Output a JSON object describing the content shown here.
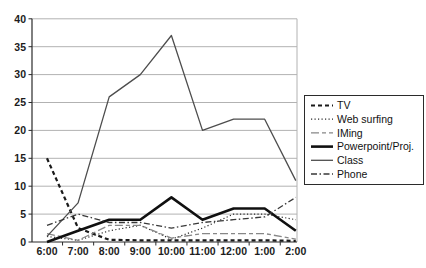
{
  "chart_data": {
    "type": "line",
    "categories": [
      "6:00",
      "7:00",
      "8:00",
      "9:00",
      "10:00",
      "11:00",
      "12:00",
      "1:00",
      "2:00"
    ],
    "series": [
      {
        "name": "TV",
        "values": [
          15,
          2.5,
          0.4,
          0.3,
          0.3,
          0.3,
          0.3,
          0.3,
          0.2
        ],
        "color": "#1a1a1a",
        "width": 2.2,
        "dash": "4,3"
      },
      {
        "name": "Web surfing",
        "values": [
          1,
          0.3,
          2,
          3,
          0.5,
          2.5,
          5,
          5,
          4
        ],
        "color": "#2b2b2b",
        "width": 1.2,
        "dash": "1.2,2.3"
      },
      {
        "name": "IMing",
        "values": [
          1.5,
          0.3,
          3,
          3,
          0.7,
          1.5,
          1.5,
          1.5,
          0.5
        ],
        "color": "#878787",
        "width": 1.3,
        "dash": "8,3,4,3"
      },
      {
        "name": "Powerpoint/Proj.",
        "values": [
          0,
          2,
          4,
          4,
          8,
          4,
          6,
          6,
          2
        ],
        "color": "#101010",
        "width": 2.6,
        "dash": ""
      },
      {
        "name": "Class",
        "values": [
          1,
          7,
          26,
          30,
          37,
          20,
          22,
          22,
          11
        ],
        "color": "#4d4d4d",
        "width": 1.3,
        "dash": ""
      },
      {
        "name": "Phone",
        "values": [
          3,
          5,
          3.5,
          3.5,
          2.5,
          3.5,
          4,
          4.5,
          8
        ],
        "color": "#383838",
        "width": 1.3,
        "dash": "6,2.5,1.5,2.5"
      }
    ],
    "ylim": [
      0,
      40
    ],
    "ytick_step": 5,
    "yticks": [
      "0",
      "5",
      "10",
      "15",
      "20",
      "25",
      "30",
      "35",
      "40"
    ],
    "grid": true,
    "legend_position": "right"
  },
  "style": {
    "background": "#ffffff",
    "grid_color": "#b2b2b2",
    "axis_color": "#2b2b2b",
    "legend_border": "#2b2b2b",
    "legend_fill": "#ffffff"
  }
}
